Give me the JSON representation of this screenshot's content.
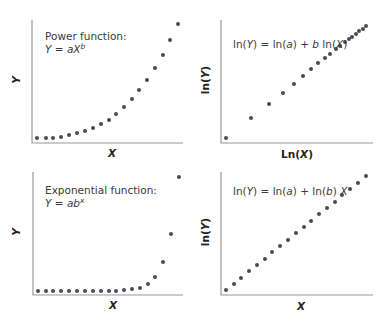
{
  "chart_data": [
    {
      "type": "scatter",
      "panel": "top-left",
      "title": "Power function:",
      "equation": "Y = aX^b",
      "xlabel": "X",
      "ylabel": "Y",
      "grid": false,
      "description": "Power-law curve, slowly rising then accelerating",
      "axes_px": {
        "x0": 32,
        "y0": 143,
        "x1": 183,
        "y1": 20
      },
      "points_px": [
        [
          37,
          138
        ],
        [
          46,
          138
        ],
        [
          53,
          138
        ],
        [
          61,
          137
        ],
        [
          69,
          135
        ],
        [
          77,
          133
        ],
        [
          85,
          131
        ],
        [
          93,
          128
        ],
        [
          101,
          124
        ],
        [
          109,
          120
        ],
        [
          116,
          114
        ],
        [
          124,
          107
        ],
        [
          132,
          99
        ],
        [
          139,
          90
        ],
        [
          147,
          80
        ],
        [
          155,
          68
        ],
        [
          163,
          55
        ],
        [
          170,
          40
        ],
        [
          178,
          24
        ]
      ]
    },
    {
      "type": "scatter",
      "panel": "top-right",
      "title": "",
      "equation": "ln(Y) = ln(a) + b ln(X)",
      "xlabel": "Ln(X)",
      "ylabel": "ln(Y)",
      "grid": false,
      "description": "Same data on log-log axes: linear, points compress toward upper right",
      "axes_px": {
        "x0": 221,
        "y0": 143,
        "x1": 373,
        "y1": 20
      },
      "points_px": [
        [
          226,
          138
        ],
        [
          251,
          118
        ],
        [
          269,
          104
        ],
        [
          283,
          93
        ],
        [
          294,
          84
        ],
        [
          303,
          76
        ],
        [
          311,
          69
        ],
        [
          318,
          63
        ],
        [
          325,
          58
        ],
        [
          330,
          54
        ],
        [
          336,
          49
        ],
        [
          340,
          46
        ],
        [
          345,
          42
        ],
        [
          349,
          39
        ],
        [
          352,
          37
        ],
        [
          356,
          34
        ],
        [
          359,
          31
        ],
        [
          363,
          29
        ],
        [
          366,
          26
        ]
      ]
    },
    {
      "type": "scatter",
      "panel": "bottom-left",
      "title": "Exponential function:",
      "equation": "Y = ab^x",
      "xlabel": "X",
      "ylabel": "Y",
      "grid": false,
      "description": "Exponential curve, flat then sharply rising",
      "axes_px": {
        "x0": 33,
        "y0": 295,
        "x1": 183,
        "y1": 172
      },
      "points_px": [
        [
          38,
          291
        ],
        [
          46,
          291
        ],
        [
          53,
          291
        ],
        [
          61,
          291
        ],
        [
          69,
          291
        ],
        [
          77,
          291
        ],
        [
          85,
          291
        ],
        [
          93,
          291
        ],
        [
          101,
          291
        ],
        [
          109,
          291
        ],
        [
          116,
          291
        ],
        [
          124,
          290
        ],
        [
          132,
          289
        ],
        [
          140,
          288
        ],
        [
          148,
          284
        ],
        [
          155,
          277
        ],
        [
          163,
          262
        ],
        [
          171,
          234
        ],
        [
          179,
          177
        ]
      ]
    },
    {
      "type": "scatter",
      "panel": "bottom-right",
      "title": "",
      "equation": "ln(Y) = ln(a) + ln(b) X",
      "xlabel": "X",
      "ylabel": "ln(Y)",
      "grid": false,
      "description": "Same data on semi-log axes: evenly spaced linear points",
      "axes_px": {
        "x0": 221,
        "y0": 295,
        "x1": 373,
        "y1": 172
      },
      "points_px": [
        [
          226,
          290
        ],
        [
          234,
          284
        ],
        [
          241,
          278
        ],
        [
          249,
          271
        ],
        [
          257,
          265
        ],
        [
          265,
          259
        ],
        [
          272,
          252
        ],
        [
          280,
          246
        ],
        [
          288,
          240
        ],
        [
          296,
          233
        ],
        [
          304,
          227
        ],
        [
          311,
          221
        ],
        [
          319,
          214
        ],
        [
          327,
          208
        ],
        [
          335,
          202
        ],
        [
          342,
          195
        ],
        [
          350,
          189
        ],
        [
          358,
          183
        ],
        [
          366,
          176
        ]
      ]
    }
  ],
  "text": {
    "tl_title": "Power function:",
    "tl_eq_lhs": "Y",
    "tl_eq_mid": " = ",
    "tl_eq_a": "aX",
    "tl_eq_sup": "b",
    "tl_xlabel": "X",
    "tl_ylabel": "Y",
    "tr_eq_1": "ln(",
    "tr_eq_Y": "Y",
    "tr_eq_2": ") = ln(",
    "tr_eq_a": "a",
    "tr_eq_3": ") + ",
    "tr_eq_b": "b",
    "tr_eq_4": " ln(",
    "tr_eq_X": "X",
    "tr_eq_5": ")",
    "tr_xlabel_1": "Ln(",
    "tr_xlabel_X": "X",
    "tr_xlabel_2": ")",
    "tr_ylabel_1": "ln(",
    "tr_ylabel_Y": "Y",
    "tr_ylabel_2": ")",
    "bl_title": "Exponential function:",
    "bl_eq_lhs": "Y",
    "bl_eq_mid": " = ",
    "bl_eq_ab": "ab",
    "bl_eq_sup": "x",
    "bl_xlabel": "X",
    "bl_ylabel": "Y",
    "br_eq_1": "ln(",
    "br_eq_Y": "Y",
    "br_eq_2": ") = ln(",
    "br_eq_a": "a",
    "br_eq_3": ") +  ln(",
    "br_eq_b": "b",
    "br_eq_4": ") ",
    "br_eq_X": "X",
    "br_xlabel": "X",
    "br_ylabel_1": "ln(",
    "br_ylabel_Y": "Y",
    "br_ylabel_2": ")"
  },
  "colors": {
    "point": "#4a4a55",
    "axis": "#9a9a9a",
    "text": "#3a3a3a"
  }
}
